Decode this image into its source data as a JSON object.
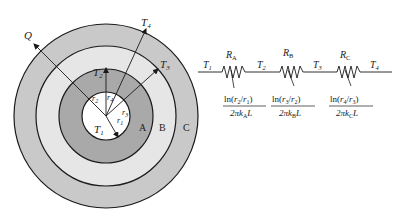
{
  "colors": {
    "ring_c": "#c9c9c9",
    "ring_b": "#e6e6e6",
    "ring_a": "#a9a9a9",
    "core": "#ffffff",
    "stroke": "#1a1a1a"
  },
  "cylinder": {
    "labels": {
      "heat_flow": "Q",
      "t1": "T",
      "t1_sub": "1",
      "t2": "T",
      "t2_sub": "2",
      "t3": "T",
      "t3_sub": "3",
      "t4": "T",
      "t4_sub": "4",
      "r1": "r",
      "r1_sub": "1",
      "r2": "r",
      "r2_sub": "2",
      "r3": "r",
      "r3_sub": "3",
      "r4": "r",
      "r4_sub": "4",
      "layer_a": "A",
      "layer_b": "B",
      "layer_c": "C"
    }
  },
  "circuit": {
    "nodes": [
      {
        "main": "T",
        "sub": "1"
      },
      {
        "main": "T",
        "sub": "2"
      },
      {
        "main": "T",
        "sub": "3"
      },
      {
        "main": "T",
        "sub": "4"
      }
    ],
    "resistors": [
      {
        "main": "R",
        "sub": "A",
        "num_pre": "ln(",
        "num_a": "r",
        "num_a_sub": "2",
        "num_mid": "/",
        "num_b": "r",
        "num_b_sub": "1",
        "num_post": ")",
        "den_pre": "2πk",
        "den_sub": "A",
        "den_post": "L"
      },
      {
        "main": "R",
        "sub": "B",
        "num_pre": "ln(",
        "num_a": "r",
        "num_a_sub": "3",
        "num_mid": "/",
        "num_b": "r",
        "num_b_sub": "2",
        "num_post": ")",
        "den_pre": "2πk",
        "den_sub": "B",
        "den_post": "L"
      },
      {
        "main": "R",
        "sub": "C",
        "num_pre": "ln(",
        "num_a": "r",
        "num_a_sub": "4",
        "num_mid": "/",
        "num_b": "r",
        "num_b_sub": "3",
        "num_post": ")",
        "den_pre": "2πk",
        "den_sub": "C",
        "den_post": "L"
      }
    ]
  }
}
